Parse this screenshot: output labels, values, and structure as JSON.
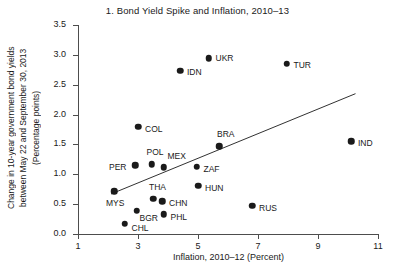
{
  "chart_data": {
    "type": "scatter",
    "title": "1. Bond Yield Spike and Inflation, 2010–13",
    "xlabel": "Inflation, 2010–12 (Percent)",
    "ylabel_lines": [
      "Change in 10-year government bond yields",
      "between May 22 and September 30, 2013",
      "(Percentage points)"
    ],
    "xlim": [
      1,
      11
    ],
    "ylim": [
      0.0,
      3.5
    ],
    "xticks": [
      "1",
      "3",
      "5",
      "7",
      "9",
      "11"
    ],
    "xtick_values": [
      1,
      3,
      5,
      7,
      9,
      11
    ],
    "yticks": [
      "0.0",
      "0.5",
      "1.0",
      "1.5",
      "2.0",
      "2.5",
      "3.0",
      "3.5"
    ],
    "ytick_values": [
      0.0,
      0.5,
      1.0,
      1.5,
      2.0,
      2.5,
      3.0,
      3.5
    ],
    "grid": false,
    "legend": "none",
    "points": [
      {
        "label": "MYS",
        "x": 2.2,
        "y": 0.72,
        "lx": -8,
        "ly": 13
      },
      {
        "label": "CHL",
        "x": 2.55,
        "y": 0.17,
        "lx": 7,
        "ly": 5
      },
      {
        "label": "PER",
        "x": 2.9,
        "y": 1.15,
        "lx": -26,
        "ly": 3
      },
      {
        "label": "BGR",
        "x": 2.95,
        "y": 0.39,
        "lx": 3,
        "ly": 8
      },
      {
        "label": "COL",
        "x": 3.0,
        "y": 1.8,
        "lx": 7,
        "ly": 3
      },
      {
        "label": "POL",
        "x": 3.45,
        "y": 1.17,
        "lx": -5,
        "ly": -11
      },
      {
        "label": "THA",
        "x": 3.5,
        "y": 0.59,
        "lx": -4,
        "ly": -11
      },
      {
        "label": "CHN",
        "x": 3.8,
        "y": 0.55,
        "lx": 7,
        "ly": 3
      },
      {
        "label": "PHL",
        "x": 3.85,
        "y": 0.33,
        "lx": 7,
        "ly": 4
      },
      {
        "label": "MEX",
        "x": 3.85,
        "y": 1.12,
        "lx": 4,
        "ly": -10
      },
      {
        "label": "IDN",
        "x": 4.4,
        "y": 2.73,
        "lx": 7,
        "ly": 2
      },
      {
        "label": "ZAF",
        "x": 4.95,
        "y": 1.13,
        "lx": 7,
        "ly": 3
      },
      {
        "label": "HUN",
        "x": 5.0,
        "y": 0.81,
        "lx": 7,
        "ly": 3
      },
      {
        "label": "UKR",
        "x": 5.35,
        "y": 2.94,
        "lx": 7,
        "ly": 1
      },
      {
        "label": "BRA",
        "x": 5.7,
        "y": 1.47,
        "lx": -2,
        "ly": -11
      },
      {
        "label": "RUS",
        "x": 6.8,
        "y": 0.47,
        "lx": 7,
        "ly": 3
      },
      {
        "label": "TUR",
        "x": 7.95,
        "y": 2.85,
        "lx": 7,
        "ly": 2
      },
      {
        "label": "IND",
        "x": 10.1,
        "y": 1.55,
        "lx": 7,
        "ly": 3
      }
    ],
    "trendline": {
      "x0": 2.1,
      "y0": 0.67,
      "x1": 10.25,
      "y1": 2.35
    }
  }
}
